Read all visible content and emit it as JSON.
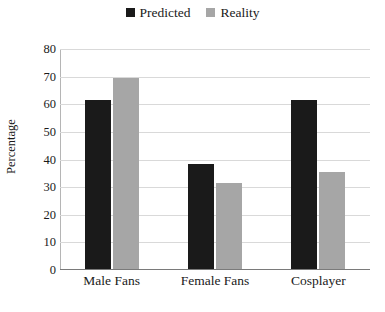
{
  "chart_data": {
    "type": "bar",
    "title": "",
    "xlabel": "",
    "ylabel": "Percentage",
    "categories": [
      "Male Fans",
      "Female Fans",
      "Cosplayer"
    ],
    "series": [
      {
        "name": "Predicted",
        "color": "#1a1a1a",
        "values": [
          61,
          38,
          61
        ]
      },
      {
        "name": "Reality",
        "color": "#a6a6a6",
        "values": [
          69,
          31,
          35
        ]
      }
    ],
    "ylim": [
      0,
      80
    ],
    "yticks": [
      0,
      10,
      20,
      30,
      40,
      50,
      60,
      70,
      80
    ],
    "ytick_labels": [
      "0",
      "10",
      "20",
      "30",
      "40",
      "50",
      "60",
      "70",
      "80"
    ],
    "grid": true,
    "grid_color": "#d9d9d9",
    "legend_position": "top-center"
  }
}
